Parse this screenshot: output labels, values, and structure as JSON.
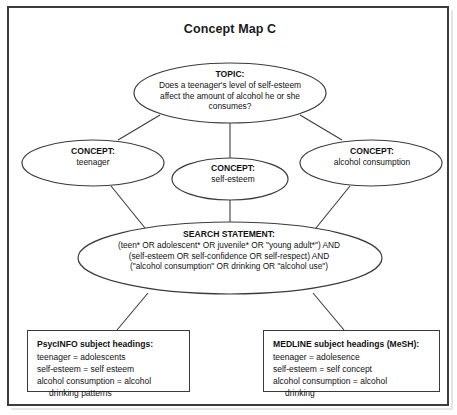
{
  "title": "Concept Map C",
  "nodes": {
    "topic": {
      "head": "TOPIC:",
      "lines": [
        "Does a teenager's level of self-esteem",
        "affect the amount of alcohol he or she",
        "consumes?"
      ]
    },
    "concept_left": {
      "head": "CONCEPT:",
      "body": "teenager"
    },
    "concept_middle": {
      "head": "CONCEPT:",
      "body": "self-esteem"
    },
    "concept_right": {
      "head": "CONCEPT:",
      "body": "alcohol consumption"
    },
    "search_statement": {
      "head": "SEARCH STATEMENT:",
      "lines": [
        "(teen* OR adolescent* OR juvenile* OR \"young adult*\") AND",
        "(self-esteem OR self-confidence OR self-respect) AND",
        "(\"alcohol consumption\" OR drinking OR \"alcohol use\")"
      ]
    }
  },
  "databases": {
    "psycinfo": {
      "head": "PsycINFO subject headings:",
      "lines": [
        "teenager = adolescents",
        "self-esteem = self esteem",
        "alcohol consumption = alcohol"
      ],
      "continuation": "drinking patterns"
    },
    "medline": {
      "head": "MEDLINE subject headings (MeSH):",
      "lines": [
        "teenager = adolesence",
        "self-esteem = self concept",
        "alcohol consumption = alcohol"
      ],
      "continuation": "drinking"
    }
  },
  "colors": {
    "stroke": "#3b3b3b",
    "text": "#111111",
    "background": "#ffffff"
  }
}
